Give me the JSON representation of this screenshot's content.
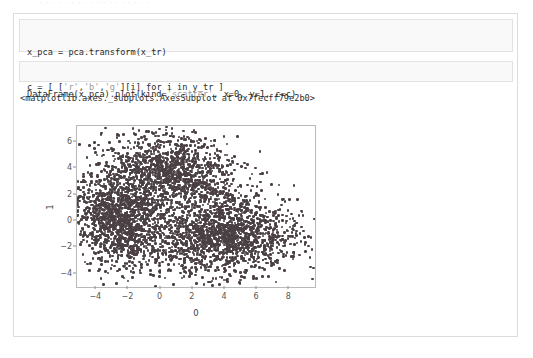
{
  "top_clip_text": "· · · · ·  ·  ·     · ·    · · · ·  · ·   · · ·",
  "notebook": {
    "cells": [
      {
        "name": "code-cell-1",
        "lines": [
          {
            "segments": [
              {
                "t": "x_pca = pca.transform(x_tr)",
                "style": "plain"
              }
            ]
          },
          {
            "segments": [
              {
                "t": "c = [ [",
                "style": "plain"
              },
              {
                "t": "'r'",
                "style": "string"
              },
              {
                "t": ",",
                "style": "plain"
              },
              {
                "t": "'b'",
                "style": "string"
              },
              {
                "t": ",",
                "style": "plain"
              },
              {
                "t": "'g'",
                "style": "string"
              },
              {
                "t": "][i] for i in y_tr ]",
                "style": "plain"
              }
            ]
          }
        ]
      },
      {
        "name": "code-cell-2",
        "lines": [
          {
            "segments": [
              {
                "t": "DataFrame(x_pca).plot(kind=",
                "style": "plain"
              },
              {
                "t": "'scatter'",
                "style": "string"
              },
              {
                "t": ", x=0, y=1, c=c)",
                "style": "plain"
              }
            ]
          }
        ]
      }
    ],
    "output_text": "<matplotlib.axes._subplots.AxesSubplot at 0x7fecff79e2b0>"
  },
  "chart_data": {
    "type": "scatter",
    "title": "",
    "xlabel": "0",
    "ylabel": "1",
    "xlim": [
      -5.2,
      9.6
    ],
    "ylim": [
      -5.0,
      7.2
    ],
    "xticks": [
      -4,
      -2,
      0,
      2,
      4,
      6,
      8
    ],
    "xticklabels": [
      "−4",
      "−2",
      "0",
      "2",
      "4",
      "6",
      "8"
    ],
    "yticks": [
      -4,
      -2,
      0,
      2,
      4,
      6
    ],
    "yticklabels": [
      "−4",
      "−2",
      "0",
      "2",
      "4",
      "6"
    ],
    "grid": false,
    "legend": null,
    "marker_color": "#4a4043",
    "marker_size_px": 2.6,
    "point_count": 4200,
    "clusters": [
      {
        "name": "upper-left lobe",
        "cx": -2.6,
        "cy": 0.2,
        "sx": 1.45,
        "sy": 1.85,
        "rot_deg": 18,
        "weight": 0.33
      },
      {
        "name": "upper-center lobe",
        "cx": 0.6,
        "cy": 3.6,
        "sx": 2.05,
        "sy": 1.55,
        "rot_deg": -12,
        "weight": 0.3
      },
      {
        "name": "lower-right lobe",
        "cx": 4.0,
        "cy": -1.2,
        "sx": 2.35,
        "sy": 1.45,
        "rot_deg": 8,
        "weight": 0.37
      }
    ]
  }
}
